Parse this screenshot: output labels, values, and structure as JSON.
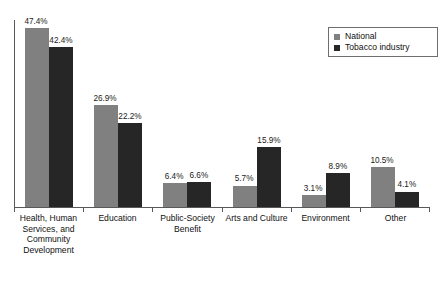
{
  "chart_data": {
    "type": "bar",
    "title": "",
    "subtitle": "",
    "xlabel": "",
    "ylabel": "",
    "ylim": [
      0,
      50
    ],
    "grid": false,
    "legend_position": "top-right",
    "orientation": "vertical",
    "grouping": "grouped",
    "value_suffix": "%",
    "categories": [
      "Health, Human Services, and Community Development",
      "Education",
      "Public-Society Benefit",
      "Arts and Culture",
      "Environment",
      "Other"
    ],
    "series": [
      {
        "name": "National",
        "color": "#808080",
        "values": [
          47.4,
          26.9,
          6.4,
          5.7,
          3.1,
          10.5
        ],
        "labels": [
          "47.4%",
          "26.9%",
          "6.4%",
          "5.7%",
          "3.1%",
          "10.5%"
        ]
      },
      {
        "name": "Tobacco industry",
        "color": "#262626",
        "values": [
          42.4,
          22.2,
          6.6,
          15.9,
          8.9,
          4.1
        ],
        "labels": [
          "42.4%",
          "22.2%",
          "6.6%",
          "15.9%",
          "8.9%",
          "4.1%"
        ]
      }
    ]
  },
  "legend": {
    "items": [
      {
        "label": "National",
        "color": "#808080"
      },
      {
        "label": "Tobacco industry",
        "color": "#262626"
      }
    ]
  },
  "axis": {
    "category_labels": [
      "Health, Human Services, and Community Development",
      "Education",
      "Public-Society Benefit",
      "Arts and Culture",
      "Environment",
      "Other"
    ]
  }
}
